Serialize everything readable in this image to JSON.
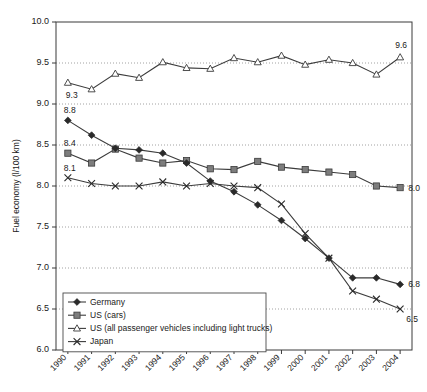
{
  "chart_data": {
    "type": "line",
    "title": "",
    "xlabel": "",
    "ylabel": "Fuel economy (l/100 km)",
    "ylim": [
      6.0,
      10.0
    ],
    "ytick_labels": [
      "10.0",
      "9.5",
      "9.0",
      "8.5",
      "8.0",
      "7.5",
      "7.0",
      "6.5",
      "6.0"
    ],
    "yticks": [
      10.0,
      9.5,
      9.0,
      8.5,
      8.0,
      7.5,
      7.0,
      6.5,
      6.0
    ],
    "grid": "horizontal dotted at each y tick",
    "legend_position": "bottom-left inside axes",
    "categories": [
      "1990",
      "1991",
      "1992",
      "1993",
      "1994",
      "1995",
      "1996",
      "1997",
      "1998",
      "1999",
      "2000",
      "2001",
      "2002",
      "2003",
      "2004"
    ],
    "x": [
      1990,
      1991,
      1992,
      1993,
      1994,
      1995,
      1996,
      1997,
      1998,
      1999,
      2000,
      2001,
      2002,
      2003,
      2004
    ],
    "series": [
      {
        "name": "Germany",
        "marker": "filled-diamond",
        "values": [
          8.8,
          8.62,
          8.46,
          8.44,
          8.4,
          8.28,
          8.06,
          7.93,
          7.77,
          7.58,
          7.36,
          7.12,
          6.88,
          6.88,
          6.8
        ]
      },
      {
        "name": "US (cars)",
        "marker": "filled-square",
        "values": [
          8.4,
          8.28,
          8.45,
          8.34,
          8.28,
          8.31,
          8.21,
          8.2,
          8.3,
          8.23,
          8.2,
          8.17,
          8.14,
          8.0,
          7.98
        ]
      },
      {
        "name": "US (all passenger vehicles including light trucks)",
        "marker": "open-triangle",
        "values": [
          9.26,
          9.18,
          9.37,
          9.32,
          9.51,
          9.44,
          9.43,
          9.56,
          9.51,
          9.59,
          9.48,
          9.54,
          9.5,
          9.36,
          9.57
        ]
      },
      {
        "name": "Japan",
        "marker": "cross",
        "values": [
          8.1,
          8.03,
          8.0,
          8.0,
          8.05,
          8.0,
          8.03,
          8.0,
          7.98,
          7.78,
          7.42,
          7.12,
          6.72,
          6.62,
          6.5
        ]
      }
    ],
    "annotations": [
      {
        "text": "9.3",
        "series": "US (all passenger vehicles including light trucks)",
        "x": 1990,
        "value": 9.26,
        "placement": "below-left"
      },
      {
        "text": "8.8",
        "series": "Germany",
        "x": 1990,
        "value": 8.8,
        "placement": "above-left"
      },
      {
        "text": "8.4",
        "series": "US (cars)",
        "x": 1990,
        "value": 8.4,
        "placement": "above-left"
      },
      {
        "text": "8.1",
        "series": "Japan",
        "x": 1990,
        "value": 8.1,
        "placement": "above-left"
      },
      {
        "text": "9.6",
        "series": "US (all passenger vehicles including light trucks)",
        "x": 2004,
        "value": 9.57,
        "placement": "above-right"
      },
      {
        "text": "8.0",
        "series": "US (cars)",
        "x": 2004,
        "value": 7.98,
        "placement": "right"
      },
      {
        "text": "6.8",
        "series": "Germany",
        "x": 2004,
        "value": 6.8,
        "placement": "right"
      },
      {
        "text": "6.5",
        "series": "Japan",
        "x": 2004,
        "value": 6.5,
        "placement": "below-right"
      }
    ]
  },
  "legend": {
    "entries": [
      {
        "label": "Germany",
        "marker": "filled-diamond"
      },
      {
        "label": "US (cars)",
        "marker": "filled-square"
      },
      {
        "label": "US (all passenger vehicles including light trucks)",
        "marker": "open-triangle"
      },
      {
        "label": "Japan",
        "marker": "cross"
      }
    ]
  },
  "colors": {
    "axis": "#3a3a3a",
    "grid": "#8a8a8a",
    "line": "#3c3c3c",
    "diamond": "#2a2a2a",
    "square": "#7d7d7d",
    "triangle_fill": "#ffffff",
    "cross": "#2a2a2a",
    "background": "#ffffff"
  }
}
